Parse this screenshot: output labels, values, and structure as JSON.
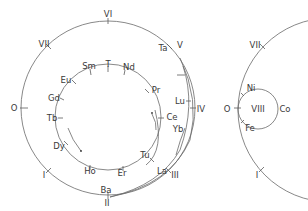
{
  "diagram": {
    "title": "",
    "left_spiral": {
      "outer_circle_labels": [
        {
          "id": "VI",
          "text": "VI",
          "x": 108,
          "y": 17,
          "anchor": "middle"
        },
        {
          "id": "VII",
          "text": "VII",
          "x": 44,
          "y": 47,
          "anchor": "middle"
        },
        {
          "id": "O",
          "text": "O",
          "x": 14,
          "y": 111,
          "anchor": "middle"
        },
        {
          "id": "I",
          "text": "I",
          "x": 44,
          "y": 178,
          "anchor": "middle"
        },
        {
          "id": "II",
          "text": "II",
          "x": 107,
          "y": 206,
          "anchor": "middle"
        },
        {
          "id": "III",
          "text": "III",
          "x": 175,
          "y": 178,
          "anchor": "middle"
        },
        {
          "id": "IV",
          "text": "IV",
          "x": 201,
          "y": 112,
          "anchor": "middle"
        },
        {
          "id": "V",
          "text": "V",
          "x": 180,
          "y": 48,
          "anchor": "middle"
        }
      ],
      "outer_element_labels": [
        {
          "id": "Ta",
          "text": "Ta",
          "x": 163,
          "y": 51,
          "anchor": "middle"
        },
        {
          "id": "Lu",
          "text": "Lu",
          "x": 182,
          "y": 104,
          "anchor": "middle"
        },
        {
          "id": "Yb",
          "text": "Yb",
          "x": 178,
          "y": 132,
          "anchor": "middle"
        },
        {
          "id": "La",
          "text": "La",
          "x": 162,
          "y": 174,
          "anchor": "middle"
        },
        {
          "id": "Ba",
          "text": "Ba",
          "x": 106,
          "y": 193,
          "anchor": "middle"
        },
        {
          "id": "Tu",
          "text": "Tu",
          "x": 145,
          "y": 158,
          "anchor": "middle"
        }
      ],
      "inner_circle_labels": [
        {
          "id": "Sm",
          "text": "Sm",
          "x": 89,
          "y": 69,
          "anchor": "middle"
        },
        {
          "id": "T",
          "text": "T",
          "x": 108,
          "y": 67,
          "anchor": "middle"
        },
        {
          "id": "Nd",
          "text": "Nd",
          "x": 129,
          "y": 70,
          "anchor": "middle"
        },
        {
          "id": "Pr",
          "text": "Pr",
          "x": 156,
          "y": 93,
          "anchor": "middle"
        },
        {
          "id": "Ce",
          "text": "Ce",
          "x": 172,
          "y": 120,
          "anchor": "middle"
        },
        {
          "id": "Eu",
          "text": "Eu",
          "x": 66,
          "y": 83,
          "anchor": "middle"
        },
        {
          "id": "Gd",
          "text": "Gd",
          "x": 54,
          "y": 101,
          "anchor": "middle"
        },
        {
          "id": "Tb",
          "text": "Tb",
          "x": 52,
          "y": 121,
          "anchor": "middle"
        },
        {
          "id": "Dy",
          "text": "Dy",
          "x": 59,
          "y": 149,
          "anchor": "middle"
        },
        {
          "id": "Ho",
          "text": "Ho",
          "x": 90,
          "y": 174,
          "anchor": "middle"
        },
        {
          "id": "Er",
          "text": "Er",
          "x": 122,
          "y": 176,
          "anchor": "middle"
        }
      ]
    },
    "right_spiral": {
      "labels": [
        {
          "id": "VII",
          "text": "VII",
          "x": 259,
          "y": 48,
          "anchor": "middle"
        },
        {
          "id": "O",
          "text": "O",
          "x": 227,
          "y": 112,
          "anchor": "middle"
        },
        {
          "id": "I",
          "text": "I",
          "x": 258,
          "y": 178,
          "anchor": "middle"
        },
        {
          "id": "VIII",
          "text": "VIII",
          "x": 265,
          "y": 112,
          "anchor": "middle"
        },
        {
          "id": "Co",
          "text": "Co",
          "x": 286,
          "y": 112,
          "anchor": "middle"
        },
        {
          "id": "Ni",
          "text": "Ni",
          "x": 251,
          "y": 90,
          "anchor": "middle"
        },
        {
          "id": "Fe",
          "text": "Fe",
          "x": 249,
          "y": 131,
          "anchor": "middle"
        }
      ]
    }
  }
}
